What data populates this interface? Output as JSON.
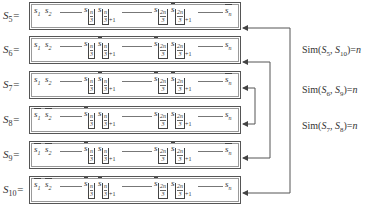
{
  "rows": [
    {
      "label": "S",
      "label_sub": "5",
      "t1": "s",
      "t1_sub": "1",
      "t1_bar": false,
      "t2": "s",
      "t2_sub": "2",
      "t2_bar": false,
      "a_bar": false,
      "b_bar": false,
      "c_bar": false,
      "d_bar": true,
      "last": "s",
      "last_sub": "n",
      "last_bar": true
    },
    {
      "label": "S",
      "label_sub": "6",
      "t1": "s",
      "t1_sub": "1",
      "t1_bar": false,
      "t2": "s",
      "t2_sub": "2",
      "t2_bar": false,
      "a_bar": false,
      "b_bar": true,
      "c_bar": true,
      "d_bar": false,
      "last": "s",
      "last_sub": "n",
      "last_bar": false
    },
    {
      "label": "S",
      "label_sub": "7",
      "t1": "s",
      "t1_sub": "1",
      "t1_bar": false,
      "t2": "s",
      "t2_sub": "2",
      "t2_bar": false,
      "a_bar": false,
      "b_bar": true,
      "c_bar": true,
      "d_bar": true,
      "last": "s",
      "last_sub": "n",
      "last_bar": true
    },
    {
      "label": "S",
      "label_sub": "8",
      "t1": "s",
      "t1_sub": "1",
      "t1_bar": true,
      "t2": "s",
      "t2_sub": "2",
      "t2_bar": true,
      "a_bar": true,
      "b_bar": false,
      "c_bar": false,
      "d_bar": false,
      "last": "s",
      "last_sub": "n",
      "last_bar": false
    },
    {
      "label": "S",
      "label_sub": "9",
      "t1": "s",
      "t1_sub": "1",
      "t1_bar": true,
      "t2": "s",
      "t2_sub": "2",
      "t2_bar": true,
      "a_bar": true,
      "b_bar": false,
      "c_bar": false,
      "d_bar": true,
      "last": "s",
      "last_sub": "n",
      "last_bar": true
    },
    {
      "label": "S",
      "label_sub": "10",
      "t1": "s",
      "t1_sub": "1",
      "t1_bar": true,
      "t2": "s",
      "t2_sub": "2",
      "t2_bar": true,
      "a_bar": true,
      "b_bar": true,
      "c_bar": true,
      "d_bar": false,
      "last": "s",
      "last_sub": "n",
      "last_bar": false
    }
  ],
  "index_labels": {
    "n3_num": "n",
    "n3_den": "3",
    "two_n3_num": "2n",
    "two_n3_den": "3",
    "plus_one": "+1",
    "var": "s",
    "eq": "="
  },
  "similarities": [
    {
      "prefix": "Sim(",
      "a": "S",
      "a_sub": "5",
      "sep": ", ",
      "b": "S",
      "b_sub": "10",
      "suffix": ")=",
      "value": "n"
    },
    {
      "prefix": "Sim(",
      "a": "S",
      "a_sub": "6",
      "sep": ", ",
      "b": "S",
      "b_sub": "9",
      "suffix": ")=",
      "value": "n"
    },
    {
      "prefix": "Sim(",
      "a": "S",
      "a_sub": "7",
      "sep": ", ",
      "b": "S",
      "b_sub": "8",
      "suffix": ")=",
      "value": "n"
    }
  ],
  "colors": {
    "line": "#555555",
    "text": "#333333",
    "background": "#ffffff"
  }
}
